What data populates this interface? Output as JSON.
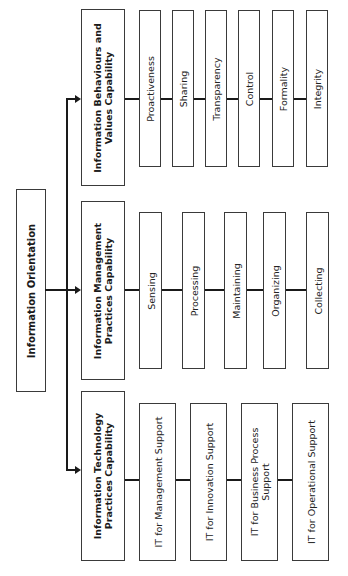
{
  "root": {
    "label": "Information Orientation"
  },
  "capabilities": [
    {
      "label_line1": "Information Behaviours and",
      "label_line2": "Values Capability",
      "items": [
        "Proactiveness",
        "Sharing",
        "Transparency",
        "Control",
        "Formality",
        "Integrity"
      ]
    },
    {
      "label_line1": "Information Management",
      "label_line2": "Practices Capability",
      "items": [
        "Sensing",
        "Processing",
        "Maintaining",
        "Organizing",
        "Collecting"
      ]
    },
    {
      "label_line1": "Information Technology",
      "label_line2": "Practices Capability",
      "items": [
        "IT for Management Support",
        "IT for Innovation Support",
        "IT for Business Process",
        "IT for Operational Support"
      ],
      "item3_line2": "Support"
    }
  ]
}
